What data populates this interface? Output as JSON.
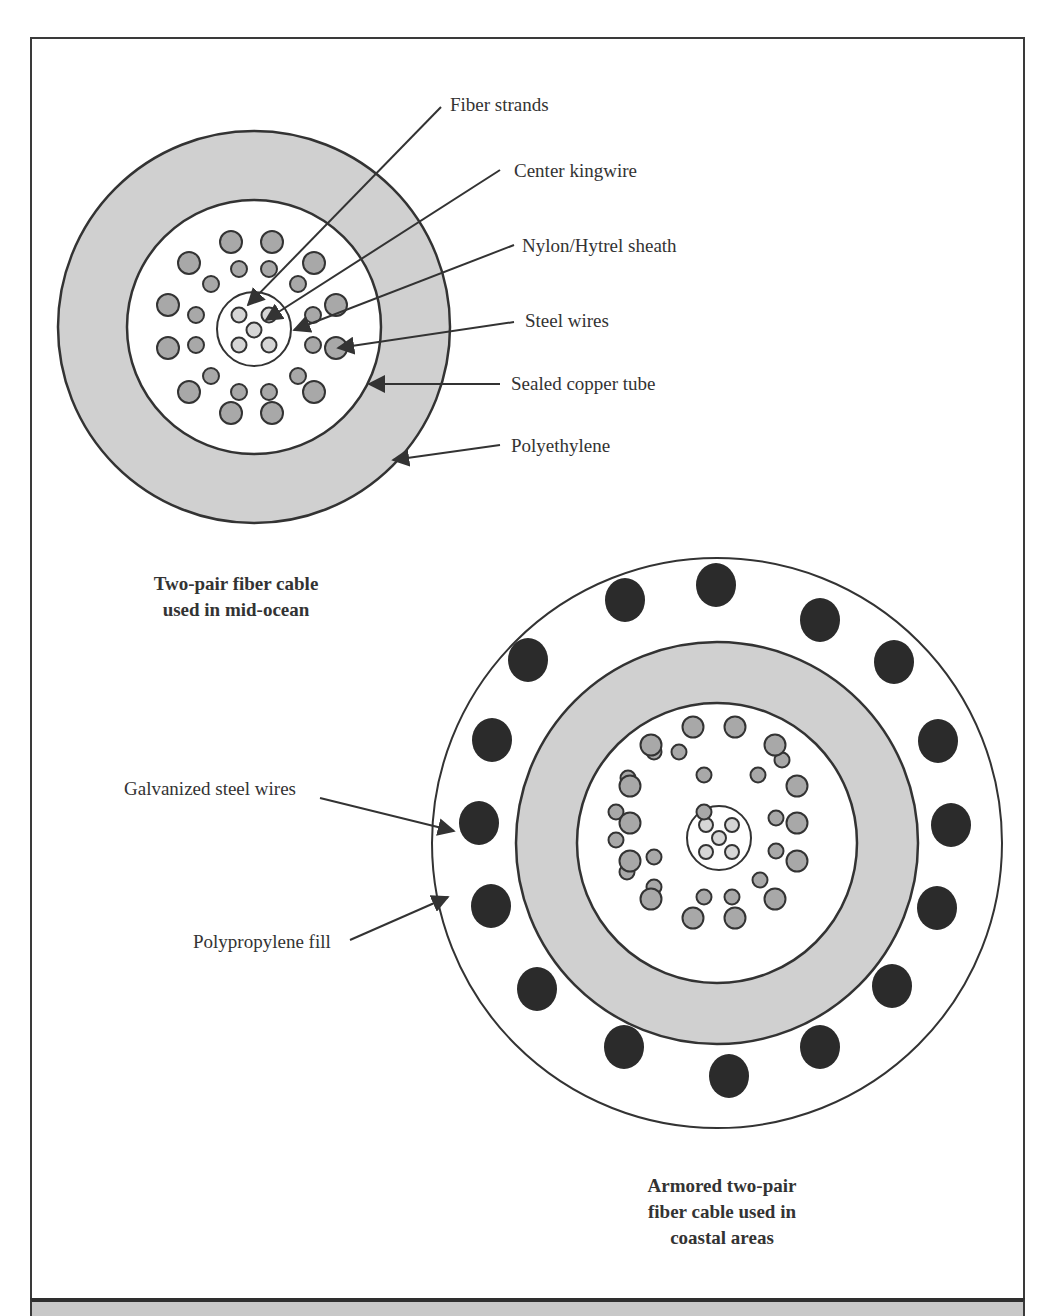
{
  "colors": {
    "frame": "#3a3a3a",
    "ring_gray": "#d0d0d0",
    "wire_gray": "#a8a8a8",
    "fiber_light": "#d6d6d6",
    "armor_dark": "#2b2b2b",
    "outline": "#333333"
  },
  "top_cable": {
    "caption_line1": "Two-pair fiber cable",
    "caption_line2": "used in mid-ocean",
    "labels": {
      "fiber_strands": "Fiber strands",
      "center_kingwire": "Center kingwire",
      "sheath": "Nylon/Hytrel sheath",
      "steel_wires": "Steel wires",
      "copper_tube": "Sealed copper tube",
      "polyethylene": "Polyethylene"
    }
  },
  "bottom_cable": {
    "caption_line1": "Armored two-pair",
    "caption_line2": "fiber cable used in",
    "caption_line3": "coastal areas",
    "labels": {
      "galvanized": "Galvanized steel wires",
      "polypropylene": "Polypropylene fill"
    }
  }
}
